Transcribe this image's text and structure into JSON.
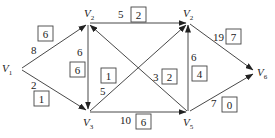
{
  "diagram": {
    "type": "directed-network-flow",
    "nodes": [
      {
        "id": "V1",
        "label": "V",
        "sub": "1",
        "x": 12,
        "y": 68
      },
      {
        "id": "V2",
        "label": "V",
        "sub": "2",
        "x": 88,
        "y": 22
      },
      {
        "id": "V4",
        "label": "V",
        "sub": "2",
        "x": 188,
        "y": 22
      },
      {
        "id": "V3",
        "label": "V",
        "sub": "3",
        "x": 88,
        "y": 113
      },
      {
        "id": "V5",
        "label": "V",
        "sub": "5",
        "x": 188,
        "y": 113
      },
      {
        "id": "V6",
        "label": "V",
        "sub": "6",
        "x": 258,
        "y": 72
      }
    ],
    "edges": [
      {
        "from": "V1",
        "to": "V2",
        "capacity": "8",
        "flow": "6"
      },
      {
        "from": "V1",
        "to": "V3",
        "capacity": "2",
        "flow": "1"
      },
      {
        "from": "V2",
        "to": "V3",
        "capacity": "6",
        "flow": "6"
      },
      {
        "from": "V2",
        "to": "V4",
        "capacity": "5",
        "flow": "2"
      },
      {
        "from": "V3",
        "to": "V4",
        "capacity": "5",
        "flow": "1"
      },
      {
        "from": "V5",
        "to": "V2",
        "capacity": "3",
        "flow": "2"
      },
      {
        "from": "V3",
        "to": "V5",
        "capacity": "10",
        "flow": "6"
      },
      {
        "from": "V5",
        "to": "V4",
        "capacity": "6",
        "flow": "4"
      },
      {
        "from": "V4",
        "to": "V6",
        "capacity": "19",
        "flow": "7"
      },
      {
        "from": "V5",
        "to": "V6",
        "capacity": "7",
        "flow": "0"
      }
    ]
  }
}
